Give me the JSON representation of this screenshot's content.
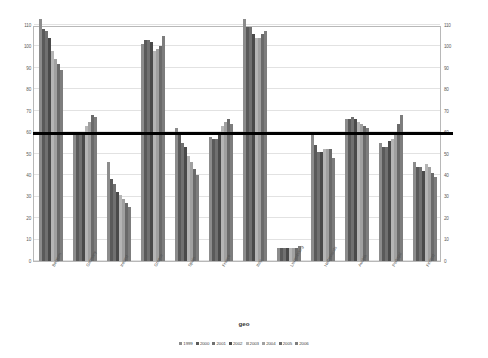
{
  "chart_data": {
    "type": "bar",
    "title": "",
    "xlabel": "geo",
    "ylabel": "",
    "ylim": [
      0,
      110
    ],
    "yticks": [
      110,
      100,
      90,
      80,
      70,
      60,
      50,
      40,
      30,
      20,
      10,
      0
    ],
    "grid": true,
    "dual_axis": true,
    "legend_position": "bottom",
    "reference_line": {
      "value": 60,
      "color": "#000000",
      "width_px": 3
    },
    "categories": [
      "Belgium",
      "Germany",
      "Ireland",
      "Greece",
      "Spain",
      "France",
      "Italy",
      "Luxembourg",
      "Netherlands",
      "Austria",
      "Portugal",
      "Finland"
    ],
    "series": [
      {
        "name": "1999",
        "color": "#8c8c8c",
        "values": [
          113,
          60,
          46,
          101,
          62,
          58,
          113,
          6,
          60,
          66,
          55,
          46
        ]
      },
      {
        "name": "2000",
        "color": "#5a5a5a",
        "values": [
          108,
          60,
          38,
          103,
          60,
          57,
          109,
          6,
          54,
          66,
          53,
          44
        ]
      },
      {
        "name": "2001",
        "color": "#707070",
        "values": [
          107,
          59,
          36,
          103,
          55,
          57,
          109,
          6,
          51,
          67,
          53,
          44
        ]
      },
      {
        "name": "2002",
        "color": "#4a4a4a",
        "values": [
          104,
          60,
          32,
          102,
          53,
          59,
          106,
          6,
          51,
          66,
          56,
          42
        ]
      },
      {
        "name": "2003",
        "color": "#b5b5b5",
        "values": [
          98,
          63,
          31,
          98,
          49,
          63,
          104,
          6,
          52,
          65,
          57,
          45
        ]
      },
      {
        "name": "2004",
        "color": "#a0a0a0",
        "values": [
          94,
          65,
          29,
          99,
          46,
          65,
          104,
          6,
          52,
          64,
          59,
          44
        ]
      },
      {
        "name": "2005",
        "color": "#6a6a6a",
        "values": [
          92,
          68,
          27,
          100,
          43,
          66,
          106,
          6,
          52,
          63,
          64,
          41
        ]
      },
      {
        "name": "2006",
        "color": "#7d7d7d",
        "values": [
          89,
          67,
          25,
          105,
          40,
          64,
          107,
          7,
          48,
          62,
          68,
          39
        ]
      }
    ]
  },
  "axis": {
    "left_ticks": [
      "110",
      "100",
      "90",
      "80",
      "70",
      "60",
      "50",
      "40",
      "30",
      "20",
      "10",
      "0"
    ],
    "right_ticks": [
      "110",
      "100",
      "90",
      "80",
      "70",
      "60",
      "50",
      "40",
      "30",
      "20",
      "10",
      "0"
    ]
  },
  "legend": {
    "items": [
      "1999",
      "2000",
      "2001",
      "2002",
      "2003",
      "2004",
      "2005",
      "2006"
    ]
  },
  "x_axis_title": "geo"
}
